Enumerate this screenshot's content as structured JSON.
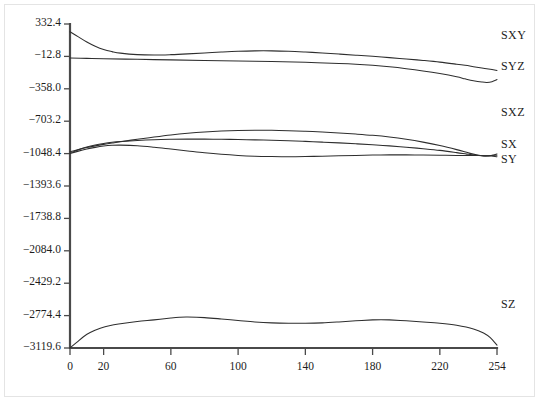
{
  "chart_data": {
    "type": "line",
    "title": "",
    "xlabel": "",
    "ylabel": "",
    "xlim": [
      0,
      254
    ],
    "ylim": [
      -3119.6,
      332.4
    ],
    "grid": false,
    "legend_position": "right-inline",
    "x_ticks": [
      0,
      20,
      60,
      100,
      140,
      180,
      220,
      254
    ],
    "x_tick_labels": [
      "0",
      "20",
      "60",
      "100",
      "140",
      "180",
      "220",
      "254"
    ],
    "y_ticks": [
      332.4,
      -12.8,
      -358.0,
      -703.2,
      -1048.4,
      -1393.6,
      -1738.8,
      -2084.0,
      -2429.2,
      -2774.4,
      -3119.6
    ],
    "y_tick_labels": [
      "332.4",
      "−12.8",
      "−358.0",
      "−703.2",
      "−1048.4",
      "−1393.6",
      "−1738.8",
      "−2084.0",
      "−2429.2",
      "−2774.4",
      "−3119.6"
    ],
    "series": [
      {
        "name": "SXY",
        "label": "SXY",
        "color": "#2e2e2e",
        "x": [
          0,
          5,
          10,
          15,
          20,
          25,
          30,
          40,
          50,
          60,
          70,
          80,
          90,
          100,
          110,
          120,
          130,
          140,
          150,
          160,
          170,
          180,
          190,
          200,
          210,
          220,
          230,
          235,
          240,
          245,
          250,
          254
        ],
        "values": [
          250,
          195,
          140,
          95,
          60,
          38,
          22,
          6,
          2,
          6,
          14,
          24,
          34,
          42,
          46,
          46,
          42,
          34,
          24,
          12,
          0,
          -12,
          -26,
          -40,
          -56,
          -74,
          -96,
          -108,
          -122,
          -136,
          -150,
          -162
        ]
      },
      {
        "name": "SYZ",
        "label": "SYZ",
        "color": "#2e2e2e",
        "x": [
          0,
          10,
          20,
          40,
          60,
          80,
          100,
          120,
          140,
          160,
          170,
          180,
          190,
          200,
          210,
          220,
          230,
          235,
          240,
          245,
          248,
          251,
          254
        ],
        "values": [
          -30,
          -34,
          -38,
          -44,
          -50,
          -56,
          -62,
          -68,
          -76,
          -88,
          -96,
          -108,
          -124,
          -144,
          -168,
          -196,
          -230,
          -252,
          -272,
          -286,
          -290,
          -282,
          -260
        ]
      },
      {
        "name": "SXZ",
        "label": "SXZ",
        "color": "#2e2e2e",
        "x": [
          0,
          5,
          10,
          15,
          20,
          25,
          30,
          40,
          50,
          60,
          70,
          80,
          90,
          100,
          110,
          120,
          130,
          140,
          150,
          160,
          170,
          180,
          190,
          200,
          210,
          220,
          230,
          238,
          244,
          248,
          251,
          254
        ],
        "values": [
          -1030,
          -1006,
          -984,
          -966,
          -950,
          -936,
          -922,
          -896,
          -872,
          -850,
          -832,
          -818,
          -808,
          -802,
          -800,
          -800,
          -804,
          -810,
          -818,
          -828,
          -840,
          -854,
          -872,
          -896,
          -926,
          -962,
          -1006,
          -1046,
          -1068,
          -1074,
          -1066,
          -1052
        ]
      },
      {
        "name": "SX",
        "label": "SX",
        "color": "#2e2e2e",
        "x": [
          0,
          5,
          10,
          15,
          20,
          25,
          30,
          40,
          50,
          60,
          70,
          80,
          90,
          100,
          110,
          120,
          130,
          140,
          150,
          160,
          170,
          180,
          190,
          200,
          210,
          220,
          230,
          236,
          241,
          245,
          249,
          254
        ],
        "values": [
          -1046,
          -1008,
          -978,
          -956,
          -940,
          -928,
          -920,
          -908,
          -900,
          -896,
          -894,
          -894,
          -896,
          -898,
          -902,
          -906,
          -912,
          -918,
          -926,
          -934,
          -944,
          -954,
          -966,
          -980,
          -996,
          -1014,
          -1038,
          -1054,
          -1066,
          -1072,
          -1072,
          -1066
        ]
      },
      {
        "name": "SY",
        "label": "SY",
        "color": "#2e2e2e",
        "x": [
          0,
          5,
          10,
          15,
          20,
          25,
          30,
          40,
          50,
          60,
          70,
          80,
          90,
          100,
          110,
          120,
          130,
          140,
          150,
          160,
          170,
          180,
          190,
          200,
          210,
          220,
          230,
          236,
          241,
          245,
          249,
          254
        ],
        "values": [
          -1048,
          -1022,
          -1000,
          -982,
          -968,
          -960,
          -958,
          -964,
          -980,
          -1000,
          -1020,
          -1040,
          -1056,
          -1068,
          -1076,
          -1080,
          -1082,
          -1080,
          -1076,
          -1072,
          -1068,
          -1064,
          -1062,
          -1062,
          -1064,
          -1066,
          -1068,
          -1068,
          -1068,
          -1068,
          -1072,
          -1082
        ]
      },
      {
        "name": "SZ",
        "label": "SZ",
        "color": "#2e2e2e",
        "x": [
          0,
          4,
          8,
          12,
          18,
          24,
          30,
          40,
          50,
          60,
          65,
          70,
          80,
          90,
          100,
          110,
          120,
          130,
          140,
          150,
          160,
          170,
          180,
          185,
          190,
          200,
          210,
          220,
          230,
          240,
          246,
          250,
          254
        ],
        "values": [
          -3119,
          -3060,
          -3000,
          -2955,
          -2910,
          -2880,
          -2862,
          -2838,
          -2820,
          -2800,
          -2792,
          -2790,
          -2796,
          -2810,
          -2826,
          -2842,
          -2852,
          -2856,
          -2856,
          -2852,
          -2842,
          -2830,
          -2820,
          -2818,
          -2820,
          -2830,
          -2842,
          -2856,
          -2878,
          -2916,
          -2960,
          -3010,
          -3090
        ]
      }
    ],
    "series_label_positions": [
      {
        "name": "SXY",
        "x_px": 497,
        "y_px": 36
      },
      {
        "name": "SYZ",
        "x_px": 497,
        "y_px": 67
      },
      {
        "name": "SXZ",
        "x_px": 497,
        "y_px": 113
      },
      {
        "name": "SX",
        "x_px": 497,
        "y_px": 145
      },
      {
        "name": "SY",
        "x_px": 497,
        "y_px": 160
      }
    ],
    "sz_label_position": {
      "name": "SZ",
      "x_px": 497,
      "y_px": 305
    }
  },
  "geometry": {
    "plot_left_px": 70,
    "plot_right_px": 497,
    "plot_top_px": 24,
    "plot_bottom_px": 348
  }
}
